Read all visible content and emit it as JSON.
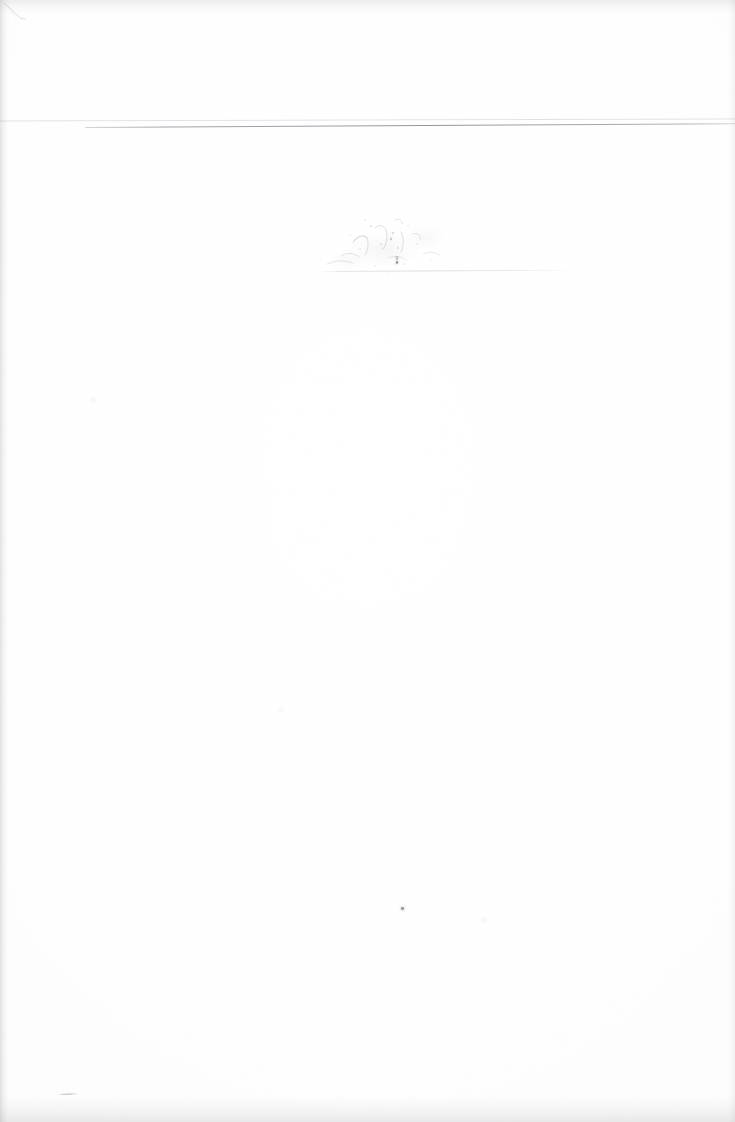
{
  "document": {
    "kind": "scanned-page",
    "title": "Blank scanned page",
    "body_text": "",
    "visible_text_count": 0,
    "note": "No legible text is present on this page.",
    "page_width": 735,
    "page_height": 1122,
    "paper_color": "#fdfdfd",
    "background_color": "#ffffff"
  },
  "marks": {
    "header_rule_light": {
      "name": "faint upper rule",
      "color": "#a0a0aa",
      "x": 0,
      "y": 120,
      "width": 735,
      "height": 2,
      "rotation_deg": -0.16
    },
    "header_rule_dark": {
      "name": "darker ruled line",
      "color": "#6c6c7a",
      "x": 85,
      "y": 127,
      "width": 650,
      "height": 1,
      "rotation_deg": -0.34
    },
    "ghost_rule": {
      "name": "faint ghost rule under smudge",
      "color": "#98969f",
      "x": 318,
      "y": 271,
      "width": 265,
      "height": 1,
      "rotation_deg": -0.28
    },
    "smudge": {
      "name": "faint offset smudge cluster",
      "color": "#96949e",
      "x": 305,
      "y": 208,
      "width": 170,
      "height": 82
    },
    "ink_dot": {
      "name": "isolated ink speck",
      "color": "#545460",
      "x": 401,
      "y": 907,
      "diameter": 3
    },
    "ink_dot_small": {
      "name": "ink speck inside smudge",
      "color": "#4c4c58",
      "x": 396,
      "y": 261,
      "diameter": 3
    },
    "pencil_dash": {
      "name": "short pencil dash near bottom-left",
      "color": "#70707e",
      "x": 58,
      "y": 1094,
      "width": 19,
      "height": 1,
      "rotation_deg": -2.4
    },
    "corner_curl": {
      "name": "faint curved mark at top-left corner",
      "color": "#8c8c98",
      "x": 3,
      "y": 2,
      "width": 26,
      "height": 20
    }
  },
  "scan_artifacts": {
    "edge_shadow_left": {
      "name": "left edge shadow",
      "color": "#808088",
      "width": 9
    },
    "edge_shadow_top": {
      "name": "top edge shadow",
      "color": "#808088",
      "height": 14
    },
    "edge_shadow_bottom": {
      "name": "bottom edge shadow",
      "color": "#808088",
      "height": 26
    },
    "edge_shadow_right": {
      "name": "right edge shadow",
      "color": "#808088",
      "width": 7
    },
    "grain": {
      "name": "scanner speckle grain",
      "color": "#96969e",
      "opacity": 0.5
    }
  }
}
